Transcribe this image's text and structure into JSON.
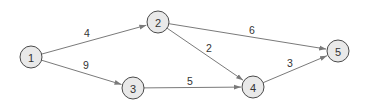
{
  "diagram": {
    "type": "directed-weighted-graph",
    "nodes": [
      {
        "id": "1",
        "label": "1",
        "x": 31,
        "y": 57
      },
      {
        "id": "2",
        "label": "2",
        "x": 158,
        "y": 22
      },
      {
        "id": "3",
        "label": "3",
        "x": 133,
        "y": 88
      },
      {
        "id": "4",
        "label": "4",
        "x": 253,
        "y": 87
      },
      {
        "id": "5",
        "label": "5",
        "x": 338,
        "y": 51
      }
    ],
    "edges": [
      {
        "from": "1",
        "to": "2",
        "weight": "4",
        "label_x": 87,
        "label_y": 33
      },
      {
        "from": "1",
        "to": "3",
        "weight": "9",
        "label_x": 86,
        "label_y": 65
      },
      {
        "from": "2",
        "to": "5",
        "weight": "6",
        "label_x": 252,
        "label_y": 30
      },
      {
        "from": "2",
        "to": "4",
        "weight": "2",
        "label_x": 209,
        "label_y": 48
      },
      {
        "from": "3",
        "to": "4",
        "weight": "5",
        "label_x": 190,
        "label_y": 81
      },
      {
        "from": "4",
        "to": "5",
        "weight": "3",
        "label_x": 290,
        "label_y": 63
      }
    ],
    "node_radius": 11,
    "colors": {
      "node_fill": "#e9e9e9",
      "node_stroke": "#4a4a4a",
      "edge": "#7a7a7a",
      "text": "#333333"
    }
  }
}
